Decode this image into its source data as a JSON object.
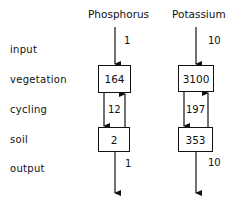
{
  "row_labels": {
    "input": "input",
    "vegetation": "vegetation",
    "cycling": "cycling",
    "soil": "soil",
    "output": "output"
  },
  "columns": [
    {
      "name": "Phosphorus",
      "input": "1",
      "vegetation": "164",
      "cycling": "12",
      "soil": "2",
      "output": "1"
    },
    {
      "name": "Potassium",
      "input": "10",
      "vegetation": "3100",
      "cycling": "197",
      "soil": "353",
      "output": "10"
    }
  ]
}
